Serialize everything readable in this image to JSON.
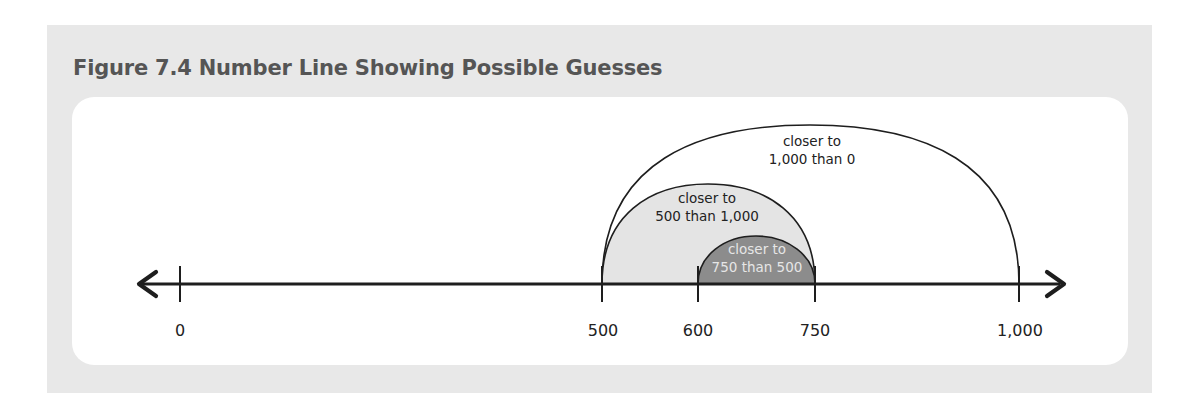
{
  "figure": {
    "title": "Figure 7.4 Number Line Showing Possible Guesses"
  },
  "number_line": {
    "ticks": [
      {
        "value": 0,
        "label": "0"
      },
      {
        "value": 500,
        "label": "500"
      },
      {
        "value": 600,
        "label": "600"
      },
      {
        "value": 750,
        "label": "750"
      },
      {
        "value": 1000,
        "label": "1,000"
      }
    ],
    "arcs": [
      {
        "from": 500,
        "to": 1000,
        "line1": "closer to",
        "line2": "1,000 than 0",
        "fill": "#ffffff",
        "text_color": "#222222"
      },
      {
        "from": 500,
        "to": 750,
        "line1": "closer to",
        "line2": "500 than 1,000",
        "fill": "#e4e4e4",
        "text_color": "#222222"
      },
      {
        "from": 600,
        "to": 750,
        "line1": "closer to",
        "line2": "750 than 500",
        "fill": "#8c8c8c",
        "text_color": "#e6e6e6"
      }
    ]
  },
  "colors": {
    "panel_bg": "#e8e8e8",
    "card_bg": "#ffffff",
    "line": "#1e1e1e",
    "title": "#555555"
  }
}
